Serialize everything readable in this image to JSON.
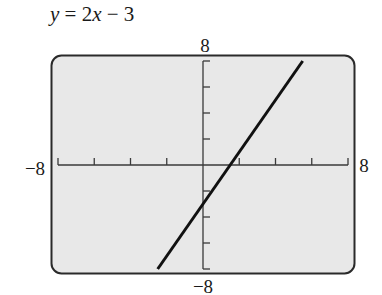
{
  "chart_data": {
    "type": "line",
    "title": "y = 2x − 3",
    "equation": "y = 2x - 3",
    "slope": 2,
    "intercept": -3,
    "xlabel": "",
    "ylabel": "",
    "xlim": [
      -8,
      8
    ],
    "ylim": [
      -8,
      8
    ],
    "x_tick_step": 2,
    "y_tick_step": 2,
    "grid": false,
    "window_labels": {
      "xmin": "−8",
      "xmax": "8",
      "ymin": "−8",
      "ymax": "8"
    },
    "series": [
      {
        "name": "y = 2x − 3",
        "x": [
          -2.5,
          5.5
        ],
        "y": [
          -8,
          8
        ]
      }
    ]
  },
  "title": {
    "y": "y",
    "eq": " = 2",
    "x": "x",
    "rest": " − 3"
  },
  "labels": {
    "xmin": "−8",
    "xmax": "8",
    "ymin": "−8",
    "ymax": "8"
  },
  "colors": {
    "screen": "#e8e8e8",
    "frame": "#2a2a2a",
    "axis": "#3a3a3a",
    "line": "#111111"
  }
}
